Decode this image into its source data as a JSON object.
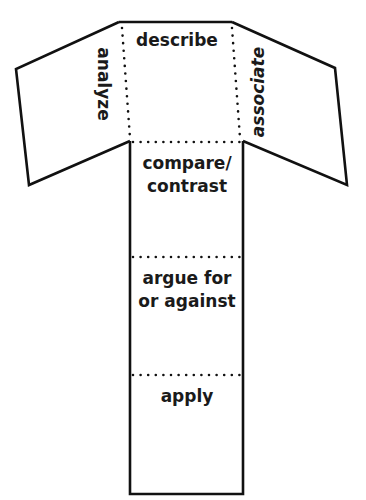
{
  "diagram": {
    "type": "foldable-template",
    "shape": "T-shaped fold-out with two angled side flaps",
    "colors": {
      "line": "#111111",
      "text": "#1a1a1a",
      "background": "#ffffff"
    },
    "panels": {
      "top_center": {
        "label": "describe"
      },
      "left_flap": {
        "label": "analyze"
      },
      "right_flap": {
        "label": "associate"
      },
      "stem_1": {
        "label_line1": "compare/",
        "label_line2": "contrast"
      },
      "stem_2": {
        "label_line1": "argue for",
        "label_line2": "or against"
      },
      "stem_3": {
        "label": "apply"
      }
    }
  }
}
